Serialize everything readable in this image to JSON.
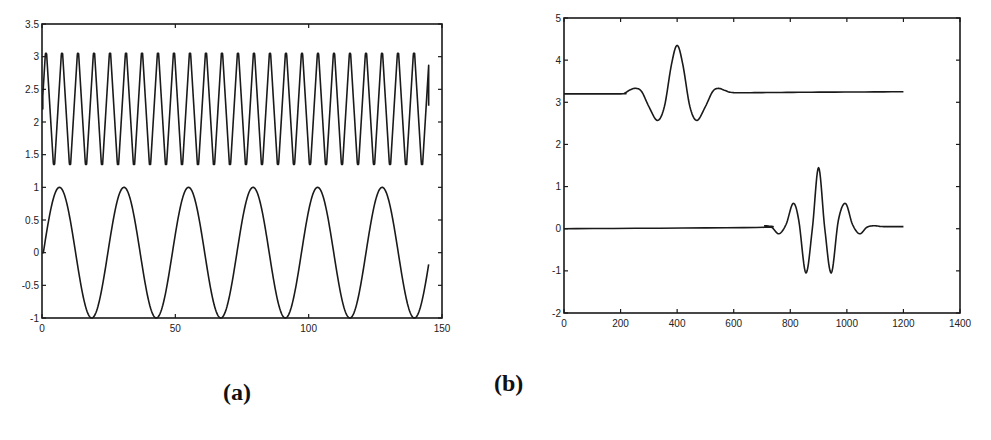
{
  "captions": {
    "a": "(a)",
    "b": "(b)"
  },
  "chart_data": [
    {
      "id": "a",
      "type": "line",
      "title": "",
      "caption": "(a)",
      "xlabel": "",
      "ylabel": "",
      "xlim": [
        0,
        150
      ],
      "ylim": [
        -1,
        3.5
      ],
      "xticks": [
        0,
        50,
        100,
        150
      ],
      "yticks": [
        -1,
        -0.5,
        0,
        0.5,
        1,
        1.5,
        2,
        2.5,
        3,
        3.5
      ],
      "ytick_labels": [
        "-1",
        "-0.5",
        "0",
        "0.5",
        "1",
        "1.5",
        "2",
        "2.5",
        "3",
        "3.5"
      ],
      "xtick_labels": [
        "0",
        "50",
        "100",
        "150"
      ],
      "grid": false,
      "legend": null,
      "series": [
        {
          "name": "upper clipped triangular oscillation",
          "description": "Fast triangular wave clipped between ~1.35 and ~3.05, starting at 2.2, ~24 cycles, ending ~2.25 at x=145",
          "generator": {
            "kind": "clipped_triangle",
            "x_start": 0,
            "x_end": 145,
            "period": 6.0,
            "phase": 1.5,
            "low": 1.35,
            "high": 3.05,
            "clip_low": 1.35,
            "clip_high": 3.05,
            "start_value": 2.2,
            "end_value": 2.25
          }
        },
        {
          "name": "lower sinusoid",
          "description": "Sine wave of amplitude 1 and period ~24, from x=0 (y=0) to x=145 (y~0.05)",
          "generator": {
            "kind": "sine",
            "x_start": 0.5,
            "x_end": 145,
            "period": 24.2,
            "amplitude": 1.0,
            "offset": 0.0,
            "phase_x": 0.5
          },
          "peaks_x": [
            6.5,
            30.5,
            55,
            78.5,
            103,
            126.5
          ],
          "troughs_x": [
            18.5,
            43,
            67,
            91,
            115,
            139
          ]
        }
      ]
    },
    {
      "id": "b",
      "type": "line",
      "title": "",
      "caption": "(b)",
      "xlabel": "",
      "ylabel": "",
      "xlim": [
        0,
        1400
      ],
      "ylim": [
        -2,
        5
      ],
      "xticks": [
        0,
        200,
        400,
        600,
        800,
        1000,
        1200,
        1400
      ],
      "xtick_labels": [
        "0",
        "200",
        "400",
        "600",
        "800",
        "1000",
        "1200",
        "1400"
      ],
      "yticks": [
        -2,
        -1,
        0,
        1,
        2,
        3,
        4,
        5
      ],
      "ytick_labels": [
        "-2",
        "-1",
        "0",
        "1",
        "2",
        "3",
        "4",
        "5"
      ],
      "grid": false,
      "legend": null,
      "series": [
        {
          "name": "upper wavelet (low frequency)",
          "points": [
            [
              0,
              3.2
            ],
            [
              200,
              3.2
            ],
            [
              215,
              3.22
            ],
            [
              235,
              3.3
            ],
            [
              255,
              3.33
            ],
            [
              275,
              3.25
            ],
            [
              300,
              2.9
            ],
            [
              330,
              2.57
            ],
            [
              355,
              2.9
            ],
            [
              380,
              3.9
            ],
            [
              400,
              4.35
            ],
            [
              420,
              3.9
            ],
            [
              445,
              2.9
            ],
            [
              470,
              2.57
            ],
            [
              500,
              2.9
            ],
            [
              525,
              3.25
            ],
            [
              545,
              3.33
            ],
            [
              570,
              3.28
            ],
            [
              600,
              3.23
            ],
            [
              700,
              3.23
            ],
            [
              900,
              3.24
            ],
            [
              1200,
              3.25
            ]
          ]
        },
        {
          "name": "lower wavelet (high frequency)",
          "points": [
            [
              0,
              0.0
            ],
            [
              680,
              0.03
            ],
            [
              710,
              0.07
            ],
            [
              735,
              0.03
            ],
            [
              760,
              -0.12
            ],
            [
              785,
              0.1
            ],
            [
              810,
              0.6
            ],
            [
              830,
              0.2
            ],
            [
              855,
              -1.05
            ],
            [
              878,
              0.0
            ],
            [
              900,
              1.45
            ],
            [
              922,
              0.0
            ],
            [
              945,
              -1.05
            ],
            [
              970,
              0.2
            ],
            [
              995,
              0.6
            ],
            [
              1020,
              0.1
            ],
            [
              1045,
              -0.12
            ],
            [
              1070,
              0.03
            ],
            [
              1095,
              0.07
            ],
            [
              1130,
              0.05
            ],
            [
              1200,
              0.05
            ]
          ]
        }
      ]
    }
  ]
}
